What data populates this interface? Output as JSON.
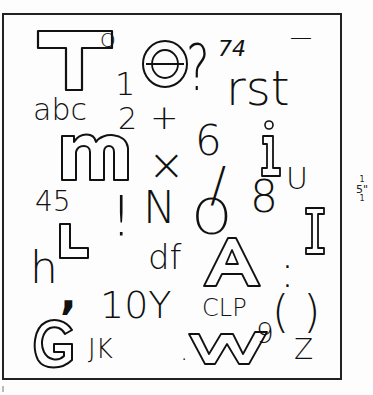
{
  "sheet": {
    "scale_label": {
      "numerator": "1",
      "denominator": "5\"",
      "tail": "1"
    }
  },
  "glyphs": {
    "outline_T": "T",
    "Q_small": "Q",
    "outline_e": "e",
    "question": "?",
    "seventy_four": "74",
    "dash": "—",
    "one": "1",
    "rst": "rst",
    "abc": "abc",
    "two": "2",
    "plus": "+",
    "outline_m": "m",
    "times_x": "×",
    "six": "6",
    "outline_i": "i",
    "slash": "/",
    "u": "U",
    "four_five": "45",
    "exclaim": "!",
    "N": "N",
    "O": "O",
    "eight": "8",
    "outline_I": "I",
    "outline_L": "L",
    "h": "h",
    "df": "df",
    "outline_A": "A",
    "colon": ":",
    "comma": ",",
    "ten_Y": "10Y",
    "CLP": "CLP",
    "parens": "( )",
    "outline_G": "G",
    "JK": "JK",
    "dot": ".",
    "outline_W": "W",
    "nine": "9",
    "z": "Z"
  }
}
